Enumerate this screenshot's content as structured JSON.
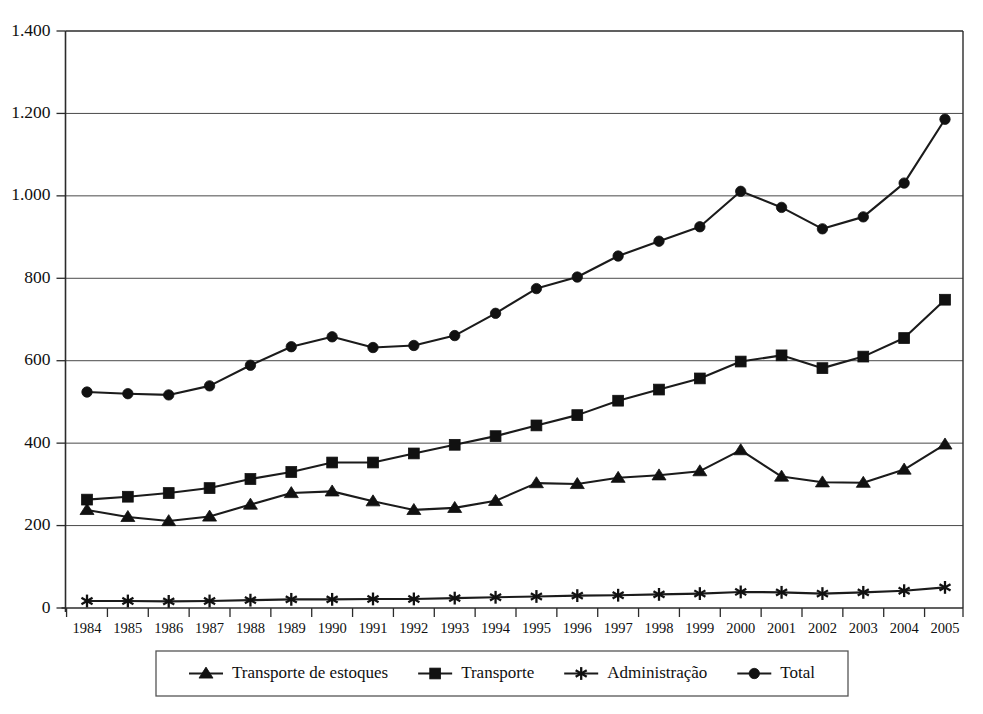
{
  "chart_data": {
    "type": "line",
    "title": "",
    "subtitle": "",
    "xlabel": "",
    "ylabel": "",
    "grid": true,
    "legend_position": "bottom",
    "xlim": [
      1984,
      2005
    ],
    "ylim": [
      0,
      1400
    ],
    "ytick_step": 200,
    "ytick_labels": [
      "0",
      "200",
      "400",
      "600",
      "800",
      "1.000",
      "1.200",
      "1.400"
    ],
    "ytick_values": [
      0,
      200,
      400,
      600,
      800,
      1000,
      1200,
      1400
    ],
    "categories": [
      "1984",
      "1985",
      "1986",
      "1987",
      "1988",
      "1989",
      "1990",
      "1991",
      "1992",
      "1993",
      "1994",
      "1995",
      "1996",
      "1997",
      "1998",
      "1999",
      "2000",
      "2001",
      "2002",
      "2003",
      "2004",
      "2005"
    ],
    "series": [
      {
        "name": "Transporte de estoques",
        "marker": "triangle",
        "values": [
          238,
          221,
          211,
          222,
          251,
          279,
          283,
          259,
          238,
          243,
          260,
          303,
          301,
          316,
          322,
          332,
          383,
          319,
          305,
          304,
          336,
          397
        ]
      },
      {
        "name": "Transporte",
        "marker": "square",
        "values": [
          263,
          270,
          279,
          291,
          313,
          330,
          353,
          353,
          375,
          396,
          417,
          443,
          468,
          503,
          530,
          557,
          598,
          613,
          582,
          610,
          655,
          748
        ]
      },
      {
        "name": "Administração",
        "marker": "star",
        "values": [
          17,
          17,
          16,
          17,
          19,
          21,
          21,
          22,
          22,
          24,
          26,
          28,
          30,
          31,
          33,
          35,
          39,
          38,
          35,
          38,
          42,
          50
        ]
      },
      {
        "name": "Total",
        "marker": "circle",
        "values": [
          524,
          520,
          517,
          539,
          589,
          634,
          658,
          632,
          637,
          661,
          715,
          775,
          803,
          854,
          890,
          925,
          1011,
          972,
          920,
          949,
          1031,
          1186
        ]
      }
    ]
  },
  "legend": {
    "entries": [
      {
        "label": "Transporte de estoques",
        "marker": "triangle"
      },
      {
        "label": "Transporte",
        "marker": "square"
      },
      {
        "label": "Administração",
        "marker": "star"
      },
      {
        "label": "Total",
        "marker": "circle"
      }
    ]
  },
  "colors": {
    "line": "#1b1b1b",
    "grid": "#4a4a4a",
    "axis": "#2b2b2b",
    "background": "#ffffff",
    "text": "#101010"
  }
}
